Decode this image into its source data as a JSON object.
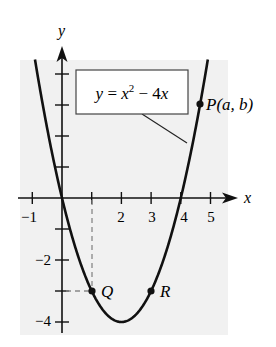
{
  "figure": {
    "equation_label": "y = x² − 4x",
    "equation_parts": {
      "lhs": "y",
      "eq": " = ",
      "x": "x",
      "exp": "2",
      "rest": " − 4",
      "x2": "x"
    },
    "axis_labels": {
      "x": "x",
      "y": "y"
    },
    "x_tick_labels": [
      "−1",
      "1",
      "2",
      "3",
      "4",
      "5"
    ],
    "x_tick_values": [
      -1,
      1,
      2,
      3,
      4,
      5
    ],
    "x_tick_labels_shown": {
      "-1": "−1",
      "2": "2",
      "3": "3",
      "4": "4",
      "5": "5"
    },
    "y_tick_labels": {
      "-2": "−2",
      "-4": "−4"
    },
    "y_tick_values": [
      -4,
      -3,
      -2,
      -1,
      1,
      2,
      3,
      4
    ],
    "points": [
      {
        "name": "P",
        "label": "P(a, b)",
        "x": 4.65,
        "y": 3.02
      },
      {
        "name": "Q",
        "label": "Q",
        "x": 1,
        "y": -3
      },
      {
        "name": "R",
        "label": "R",
        "x": 3,
        "y": -3
      }
    ],
    "colors": {
      "curve": "#111111",
      "panel": "#f1f1f1",
      "dashed": "#888888"
    }
  },
  "chart_data": {
    "type": "line",
    "title": "",
    "function": "y = x^2 - 4x",
    "xlabel": "x",
    "ylabel": "y",
    "xlim": [
      -1.3,
      5.4
    ],
    "ylim": [
      -4.3,
      4.5
    ],
    "x_ticks": [
      -1,
      1,
      2,
      3,
      4,
      5
    ],
    "x_tick_labels": [
      "-1",
      "2",
      "3",
      "4",
      "5"
    ],
    "y_ticks": [
      -4,
      -3,
      -2,
      -1,
      1,
      2,
      3,
      4
    ],
    "y_tick_labels": [
      "-2",
      "-4"
    ],
    "series": [
      {
        "name": "y = x^2 - 4x",
        "x": [
          -0.9,
          -0.5,
          0,
          0.5,
          1,
          1.5,
          2,
          2.5,
          3,
          3.5,
          4,
          4.5,
          4.9
        ],
        "y": [
          4.41,
          2.25,
          0,
          -1.75,
          -3,
          -3.75,
          -4,
          -3.75,
          -3,
          -1.75,
          0,
          2.25,
          4.41
        ]
      }
    ],
    "annotations": [
      {
        "text": "P(a, b)",
        "x": 4.65,
        "y": 3.02
      },
      {
        "text": "Q",
        "x": 1,
        "y": -3
      },
      {
        "text": "R",
        "x": 3,
        "y": -3
      },
      {
        "text": "y = x^2 - 4x",
        "type": "callout-box"
      }
    ],
    "grid": false,
    "legend": "none"
  }
}
